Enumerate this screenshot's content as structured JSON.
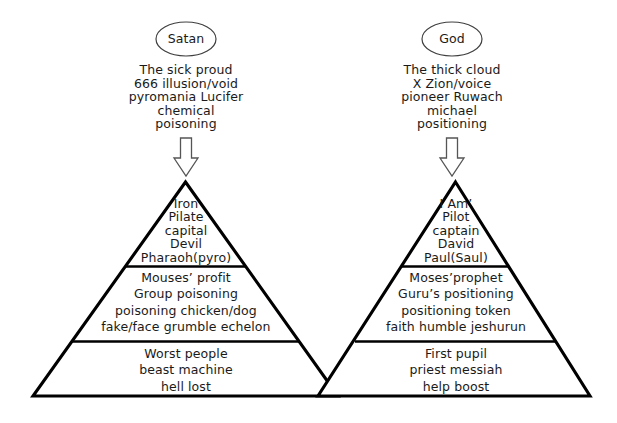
{
  "figure": {
    "background": "#ffffff",
    "stroke": "#000000"
  },
  "left": {
    "bubble": "Satan",
    "header_lines": [
      "The sick proud",
      "666 illusion/void",
      "pyromania Lucifer",
      "chemical",
      "poisoning"
    ],
    "arrow": "down-arrow",
    "tiers": [
      {
        "name": "top",
        "lines": [
          "Iron",
          "Pilate",
          "capital",
          "Devil",
          "Pharaoh(pyro)"
        ]
      },
      {
        "name": "middle",
        "lines": [
          "Mouses’ profit",
          "Group poisoning",
          "poisoning chicken/dog",
          "fake/face grumble echelon"
        ]
      },
      {
        "name": "bottom",
        "lines": [
          "Worst people",
          "beast machine",
          "hell lost"
        ]
      }
    ]
  },
  "right": {
    "bubble": "God",
    "header_lines": [
      "The thick cloud",
      "X Zion/voice",
      "pioneer Ruwach",
      "michael",
      "positioning"
    ],
    "arrow": "down-arrow",
    "tiers": [
      {
        "name": "top",
        "lines": [
          "I Am’",
          "Pilot",
          "captain",
          "David",
          "Paul(Saul)"
        ]
      },
      {
        "name": "middle",
        "lines": [
          "Moses’prophet",
          "Guru’s positioning",
          "positioning token",
          "faith humble jeshurun"
        ]
      },
      {
        "name": "bottom",
        "lines": [
          "First pupil",
          "priest messiah",
          "help boost"
        ]
      }
    ]
  }
}
